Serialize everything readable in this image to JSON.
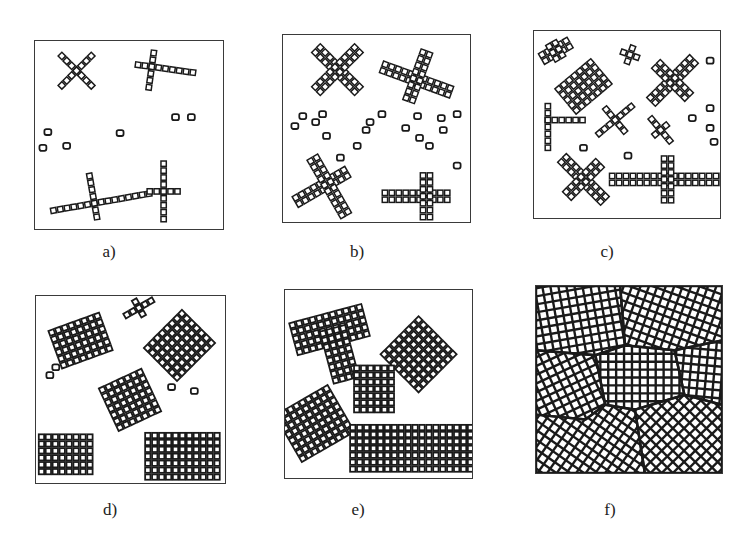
{
  "figure": {
    "colors": {
      "ink": "#1a1a1a",
      "frame": "#3a3a3a",
      "background": "#ffffff"
    },
    "panels": [
      {
        "id": "a",
        "label": "a)",
        "box": [
          34,
          40,
          190,
          190
        ],
        "label_pos": [
          109,
          242
        ],
        "cell": 7,
        "grains": [
          {
            "type": "cross",
            "cx": 42,
            "cy": 30,
            "rot": 45,
            "arms": [
              [
                -3,
                3
              ],
              [
                -3,
                3
              ]
            ],
            "w": 1
          },
          {
            "type": "cross",
            "cx": 118,
            "cy": 26,
            "rot": 8,
            "arms": [
              [
                -2,
                6
              ],
              [
                -2,
                3
              ]
            ],
            "w": 1
          },
          {
            "type": "cross",
            "cx": 60,
            "cy": 164,
            "rot": -10,
            "arms": [
              [
                -6,
                8
              ],
              [
                -4,
                2
              ]
            ],
            "w": 1
          },
          {
            "type": "cross",
            "cx": 130,
            "cy": 152,
            "rot": 0,
            "arms": [
              [
                -2,
                2
              ],
              [
                -4,
                4
              ]
            ],
            "w": 1
          }
        ],
        "nuclei": [
          [
            13,
            92
          ],
          [
            8,
            108
          ],
          [
            32,
            106
          ],
          [
            86,
            93
          ],
          [
            142,
            77
          ],
          [
            158,
            77
          ]
        ]
      },
      {
        "id": "b",
        "label": "b)",
        "box": [
          282,
          34,
          189,
          189
        ],
        "label_pos": [
          357,
          242
        ],
        "cell": 7,
        "grains": [
          {
            "type": "cross",
            "cx": 55,
            "cy": 35,
            "rot": 45,
            "arms": [
              [
                -4,
                4
              ],
              [
                -4,
                4
              ]
            ],
            "w": 2
          },
          {
            "type": "cross",
            "cx": 135,
            "cy": 45,
            "rot": 20,
            "arms": [
              [
                -5,
                5
              ],
              [
                -4,
                3
              ]
            ],
            "w": 2
          },
          {
            "type": "cross",
            "cx": 45,
            "cy": 150,
            "rot": -30,
            "arms": [
              [
                -5,
                3
              ],
              [
                -4,
                5
              ]
            ],
            "w": 2
          },
          {
            "type": "cross",
            "cx": 145,
            "cy": 163,
            "rot": 0,
            "arms": [
              [
                -6,
                3
              ],
              [
                -3,
                3
              ]
            ],
            "w": 2
          }
        ],
        "nuclei": [
          [
            12,
            92
          ],
          [
            20,
            82
          ],
          [
            33,
            88
          ],
          [
            40,
            80
          ],
          [
            44,
            102
          ],
          [
            58,
            124
          ],
          [
            75,
            112
          ],
          [
            84,
            96
          ],
          [
            88,
            88
          ],
          [
            100,
            80
          ],
          [
            124,
            94
          ],
          [
            136,
            82
          ],
          [
            138,
            104
          ],
          [
            148,
            112
          ],
          [
            160,
            84
          ],
          [
            162,
            96
          ],
          [
            176,
            80
          ],
          [
            176,
            132
          ]
        ]
      },
      {
        "id": "c",
        "label": "c)",
        "box": [
          533,
          30,
          188,
          189
        ],
        "label_pos": [
          607,
          242
        ],
        "cell": 7,
        "grains": [
          {
            "type": "cross",
            "cx": 22,
            "cy": 20,
            "rot": -30,
            "arms": [
              [
                -2,
                2
              ],
              [
                -1,
                1
              ]
            ],
            "w": 2
          },
          {
            "type": "block",
            "cx": 50,
            "cy": 56,
            "rot": -40,
            "cols": 7,
            "rows": 5
          },
          {
            "type": "cross",
            "cx": 97,
            "cy": 24,
            "rot": 20,
            "arms": [
              [
                -1,
                1
              ],
              [
                -1,
                1
              ]
            ],
            "w": 1
          },
          {
            "type": "cross",
            "cx": 140,
            "cy": 50,
            "rot": -45,
            "arms": [
              [
                -4,
                4
              ],
              [
                -3,
                3
              ]
            ],
            "w": 2
          },
          {
            "type": "cross",
            "cx": 14,
            "cy": 90,
            "rot": 0,
            "arms": [
              [
                0,
                5
              ],
              [
                -2,
                4
              ]
            ],
            "w": 1
          },
          {
            "type": "cross",
            "cx": 82,
            "cy": 90,
            "rot": -40,
            "arms": [
              [
                -3,
                3
              ],
              [
                -2,
                2
              ]
            ],
            "w": 1
          },
          {
            "type": "cross",
            "cx": 128,
            "cy": 100,
            "rot": 50,
            "arms": [
              [
                -2,
                2
              ],
              [
                -1,
                1
              ]
            ],
            "w": 1
          },
          {
            "type": "cross",
            "cx": 50,
            "cy": 150,
            "rot": 45,
            "arms": [
              [
                -4,
                4
              ],
              [
                -3,
                3
              ]
            ],
            "w": 2
          },
          {
            "type": "cross",
            "cx": 135,
            "cy": 150,
            "rot": 0,
            "arms": [
              [
                -8,
                8
              ],
              [
                -3,
                3
              ]
            ],
            "w": 2
          }
        ],
        "nuclei": [
          [
            178,
            30
          ],
          [
            178,
            78
          ],
          [
            160,
            88
          ],
          [
            178,
            98
          ],
          [
            182,
            112
          ],
          [
            50,
            118
          ],
          [
            95,
            126
          ]
        ]
      },
      {
        "id": "d",
        "label": "d)",
        "box": [
          35,
          295,
          191,
          189
        ],
        "label_pos": [
          110,
          500
        ],
        "cell": 7,
        "grains": [
          {
            "type": "block",
            "cx": 45,
            "cy": 45,
            "rot": -20,
            "cols": 8,
            "rows": 6
          },
          {
            "type": "block",
            "cx": 145,
            "cy": 50,
            "rot": -45,
            "cols": 8,
            "rows": 7
          },
          {
            "type": "block",
            "cx": 95,
            "cy": 105,
            "rot": -25,
            "cols": 7,
            "rows": 7
          },
          {
            "type": "block",
            "cx": 30,
            "cy": 160,
            "rot": 0,
            "cols": 8,
            "rows": 6
          },
          {
            "type": "block",
            "cx": 148,
            "cy": 162,
            "rot": 0,
            "cols": 11,
            "rows": 7
          },
          {
            "type": "cross",
            "cx": 104,
            "cy": 12,
            "rot": -30,
            "arms": [
              [
                -2,
                2
              ],
              [
                -1,
                1
              ]
            ],
            "w": 1
          }
        ],
        "nuclei": [
          [
            14,
            80
          ],
          [
            20,
            72
          ],
          [
            137,
            92
          ],
          [
            160,
            96
          ]
        ]
      },
      {
        "id": "e",
        "label": "e)",
        "box": [
          284,
          289,
          189,
          190
        ],
        "label_pos": [
          358,
          500
        ],
        "cell": 7,
        "grains": [
          {
            "type": "block",
            "cx": 45,
            "cy": 40,
            "rot": -15,
            "cols": 11,
            "rows": 5
          },
          {
            "type": "block",
            "cx": 55,
            "cy": 65,
            "rot": -15,
            "cols": 4,
            "rows": 8
          },
          {
            "type": "block",
            "cx": 135,
            "cy": 65,
            "rot": -45,
            "cols": 8,
            "rows": 8
          },
          {
            "type": "block",
            "cx": 90,
            "cy": 100,
            "rot": 0,
            "cols": 6,
            "rows": 7
          },
          {
            "type": "block",
            "cx": 30,
            "cy": 135,
            "rot": -30,
            "cols": 9,
            "rows": 8
          },
          {
            "type": "block",
            "cx": 128,
            "cy": 160,
            "rot": 0,
            "cols": 18,
            "rows": 7
          }
        ],
        "nuclei": []
      },
      {
        "id": "f",
        "label": "f)",
        "box": [
          535,
          285,
          188,
          189
        ],
        "label_pos": [
          610,
          500
        ],
        "cell": 8,
        "grains": [
          {
            "type": "poly",
            "rot": -10,
            "points": [
              [
                0,
                0
              ],
              [
                85,
                0
              ],
              [
                90,
                60
              ],
              [
                60,
                70
              ],
              [
                0,
                65
              ]
            ]
          },
          {
            "type": "poly",
            "rot": 20,
            "points": [
              [
                85,
                0
              ],
              [
                188,
                0
              ],
              [
                188,
                55
              ],
              [
                140,
                65
              ],
              [
                90,
                60
              ]
            ]
          },
          {
            "type": "poly",
            "rot": -25,
            "points": [
              [
                0,
                65
              ],
              [
                60,
                70
              ],
              [
                70,
                120
              ],
              [
                50,
                135
              ],
              [
                0,
                130
              ]
            ]
          },
          {
            "type": "poly",
            "rot": 0,
            "points": [
              [
                60,
                70
              ],
              [
                90,
                60
              ],
              [
                140,
                65
              ],
              [
                150,
                110
              ],
              [
                100,
                125
              ],
              [
                70,
                120
              ]
            ]
          },
          {
            "type": "poly",
            "rot": 5,
            "points": [
              [
                140,
                65
              ],
              [
                188,
                55
              ],
              [
                188,
                120
              ],
              [
                150,
                110
              ]
            ]
          },
          {
            "type": "poly",
            "rot": 35,
            "points": [
              [
                0,
                130
              ],
              [
                50,
                135
              ],
              [
                70,
                120
              ],
              [
                100,
                125
              ],
              [
                110,
                189
              ],
              [
                0,
                189
              ]
            ]
          },
          {
            "type": "poly",
            "rot": 45,
            "points": [
              [
                100,
                125
              ],
              [
                150,
                110
              ],
              [
                188,
                120
              ],
              [
                188,
                189
              ],
              [
                110,
                189
              ]
            ]
          }
        ],
        "nuclei": []
      }
    ]
  }
}
